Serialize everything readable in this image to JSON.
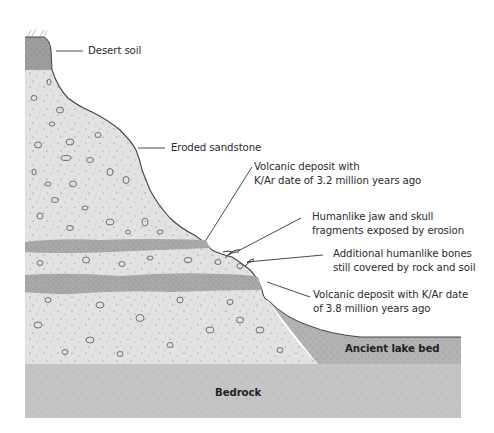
{
  "diagram": {
    "type": "geologic-cross-section",
    "colors": {
      "desert_soil": "#9e9e9e",
      "sandstone": "#e2e2e2",
      "volcanic_band": "#a9a9a9",
      "lake_bed": "#b3b3b3",
      "bedrock": "#c4c4c4",
      "outline": "#444444",
      "leader_line": "#333333"
    },
    "labels": {
      "desert_soil": "Desert soil",
      "eroded_sandstone": "Eroded sandstone",
      "volcanic_upper_line1": "Volcanic deposit with",
      "volcanic_upper_line2": "K/Ar date of 3.2 million years ago",
      "jaw_line1": "Humanlike jaw and skull",
      "jaw_line2": "fragments exposed by erosion",
      "bones_line1": "Additional humanlike bones",
      "bones_line2": "still covered by rock and soil",
      "volcanic_lower_line1": "Volcanic deposit with K/Ar date",
      "volcanic_lower_line2": "of 3.8 million years ago",
      "lake_bed": "Ancient lake bed",
      "bedrock": "Bedrock"
    },
    "layers": [
      {
        "name": "Desert soil",
        "order": 1
      },
      {
        "name": "Eroded sandstone",
        "order": 2
      },
      {
        "name": "Volcanic deposit (3.2 million years ago)",
        "order": 3
      },
      {
        "name": "Volcanic deposit (3.8 million years ago)",
        "order": 4
      },
      {
        "name": "Ancient lake bed",
        "order": 5
      },
      {
        "name": "Bedrock",
        "order": 6
      }
    ]
  }
}
